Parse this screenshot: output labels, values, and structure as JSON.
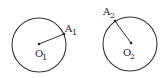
{
  "diagram": {
    "stroke_color": "#333333",
    "circles": [
      {
        "id": "circle-1",
        "center": {
          "x": 39,
          "y": 45
        },
        "radius": 27,
        "center_label": {
          "main": "O",
          "sub": "1"
        },
        "point": {
          "x": 64,
          "y": 34
        },
        "point_label": {
          "main": "A",
          "sub": "1"
        }
      },
      {
        "id": "circle-2",
        "center": {
          "x": 130,
          "y": 44
        },
        "radius": 27,
        "center_label": {
          "main": "O",
          "sub": "2"
        },
        "point": {
          "x": 115,
          "y": 21
        },
        "point_label": {
          "main": "A",
          "sub": "2"
        }
      }
    ]
  }
}
